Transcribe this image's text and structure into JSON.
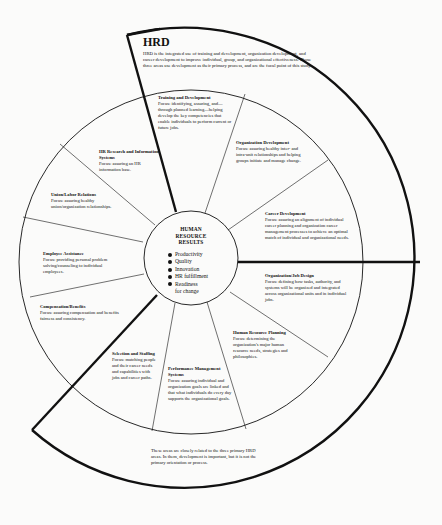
{
  "hrd": {
    "title": "HRD",
    "description": "HRD is the integrated use of training and development, organization development, and career development to improve individual, group, and organizational effectiveness. Those three areas use development as their primary process, and are the focal point of this study."
  },
  "center": {
    "title_line1": "HUMAN",
    "title_line2": "RESOURCE",
    "title_line3": "RESULTS",
    "results": [
      "Productivity",
      "Quality",
      "Innovation",
      "HR fulfillment",
      "Readiness"
    ],
    "results_continuation": "for change"
  },
  "segments": [
    {
      "title": "Training and Development",
      "focus": "Focus: identifying, assuring, and—through planned learning—helping develop the key competencies that enable individuals to perform current or future jobs."
    },
    {
      "title": "Organization Development",
      "focus": "Focus: assuring healthy inter- and intra-unit relationships and helping groups initiate and manage change."
    },
    {
      "title": "Career Development",
      "focus": "Focus: assuring an alignment of individual career planning and organization career management processes to achieve an optimal match of individual and organizational needs."
    },
    {
      "title": "Organization/Job Design",
      "focus": "Focus: defining how tasks, authority, and systems will be organized and integrated across organizational units and in individual jobs."
    },
    {
      "title": "Human Resource Planning",
      "focus": "Focus: determining the organization's major human resource needs, strategies and philosophies."
    },
    {
      "title": "Performance Management Systems",
      "focus": "Focus: assuring individual and organization goals are linked and that what individuals do every day supports the organizational goals."
    },
    {
      "title": "Selection and Staffing",
      "focus": "Focus: matching people and their career needs and capabilities with jobs and career paths."
    },
    {
      "title": "Compensation/Benefits",
      "focus": "Focus: assuring compensation and benefits fairness and consistency."
    },
    {
      "title": "Employee Assistance",
      "focus": "Focus: providing personal problem solving/counseling to individual employees."
    },
    {
      "title": "Union/Labor Relations",
      "focus": "Focus: assuring healthy union/organization relationships."
    },
    {
      "title": "HR Research and Information Systems",
      "focus": "Focus: assuring an HR information base."
    }
  ],
  "note": "These areas are closely related to the three primary HRD areas. In them, development is important, but it is not the primary orientation or process."
}
